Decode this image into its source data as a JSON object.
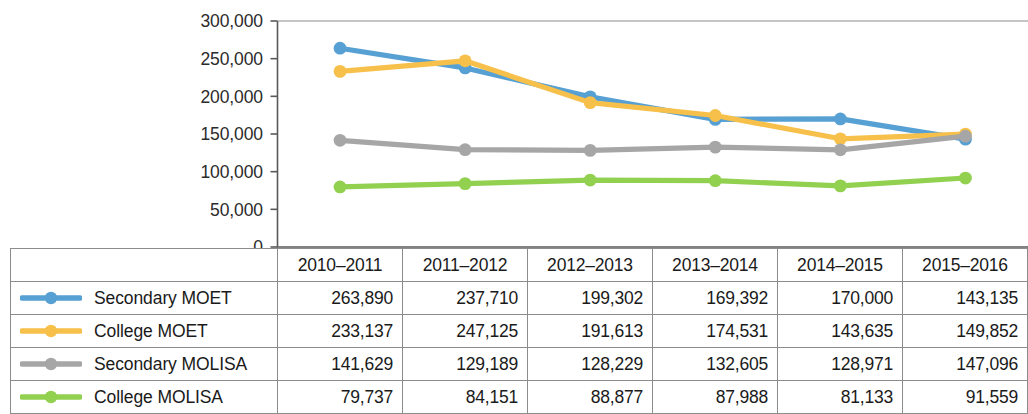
{
  "chart_data": {
    "type": "line",
    "title": "",
    "xlabel": "",
    "ylabel": "",
    "categories": [
      "2010–2011",
      "2011–2012",
      "2012–2013",
      "2013–2014",
      "2014–2015",
      "2015–2016"
    ],
    "ylim": [
      0,
      300000
    ],
    "ytick_step": 50000,
    "ytick_labels": [
      "300,000",
      "250,000",
      "200,000",
      "150,000",
      "100,000",
      "50,000",
      "0"
    ],
    "ytick_values": [
      300000,
      250000,
      200000,
      150000,
      100000,
      50000,
      0
    ],
    "grid": false,
    "legend_position": "table-left",
    "marker": "circle",
    "series": [
      {
        "name": "Secondary MOET",
        "color": "#56a0d3",
        "values": [
          263890,
          237710,
          199302,
          169392,
          170000,
          143135
        ],
        "labels": [
          "263,890",
          "237,710",
          "199,302",
          "169,392",
          "170,000",
          "143,135"
        ]
      },
      {
        "name": "College MOET",
        "color": "#f7c04a",
        "values": [
          233137,
          247125,
          191613,
          174531,
          143635,
          149852
        ],
        "labels": [
          "233,137",
          "247,125",
          "191,613",
          "174,531",
          "143,635",
          "149,852"
        ]
      },
      {
        "name": "Secondary MOLISA",
        "color": "#a6a6a6",
        "values": [
          141629,
          129189,
          128229,
          132605,
          128971,
          147096
        ],
        "labels": [
          "141,629",
          "129,189",
          "128,229",
          "132,605",
          "128,971",
          "147,096"
        ]
      },
      {
        "name": "College MOLISA",
        "color": "#92d050",
        "values": [
          79737,
          84151,
          88877,
          87988,
          81133,
          91559
        ],
        "labels": [
          "79,737",
          "84,151",
          "88,877",
          "87,988",
          "81,133",
          "91,559"
        ]
      }
    ]
  },
  "table": {
    "corner_label": "",
    "headers": [
      "2010–2011",
      "2011–2012",
      "2012–2013",
      "2013–2014",
      "2014–2015",
      "2015–2016"
    ],
    "rows": [
      {
        "label": "Secondary MOET",
        "color": "#56a0d3",
        "cells": [
          "263,890",
          "237,710",
          "199,302",
          "169,392",
          "170,000",
          "143,135"
        ]
      },
      {
        "label": "College MOET",
        "color": "#f7c04a",
        "cells": [
          "233,137",
          "247,125",
          "191,613",
          "174,531",
          "143,635",
          "149,852"
        ]
      },
      {
        "label": "Secondary MOLISA",
        "color": "#a6a6a6",
        "cells": [
          "141,629",
          "129,189",
          "128,229",
          "132,605",
          "128,971",
          "147,096"
        ]
      },
      {
        "label": "College MOLISA",
        "color": "#92d050",
        "cells": [
          "79,737",
          "84,151",
          "88,877",
          "87,988",
          "81,133",
          "91,559"
        ]
      }
    ]
  }
}
